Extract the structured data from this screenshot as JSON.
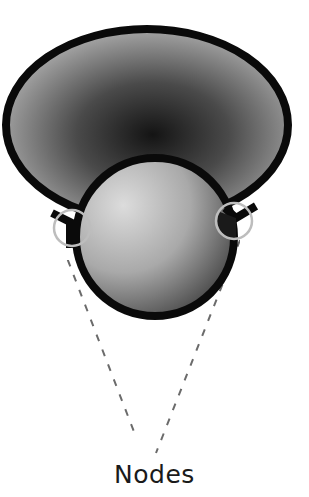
{
  "diagram": {
    "label": "Nodes",
    "colors": {
      "outline": "#0a0a0a",
      "outer_fill_dark": "#1c1c1c",
      "outer_fill_light": "#a8a8a8",
      "inner_fill_light": "#d6d6d6",
      "inner_fill_dark": "#4a4a4a",
      "node_ring": "#bdbdbd",
      "dashed_line": "#6b6b6b"
    },
    "shapes": [
      {
        "id": "outer-shape",
        "type": "ellipse",
        "cx": 147,
        "cy": 125,
        "rx": 143,
        "ry": 97
      },
      {
        "id": "inner-shape",
        "type": "circle",
        "cx": 155,
        "cy": 238,
        "r": 80
      }
    ],
    "nodes": [
      {
        "id": "node-left",
        "cx": 72,
        "cy": 228,
        "r": 18
      },
      {
        "id": "node-right",
        "cx": 234,
        "cy": 221,
        "r": 18
      }
    ],
    "connectors": [
      {
        "from": "node-left",
        "to_x": 136,
        "to_y": 437
      },
      {
        "from": "node-right",
        "to_x": 156,
        "to_y": 453
      }
    ]
  }
}
